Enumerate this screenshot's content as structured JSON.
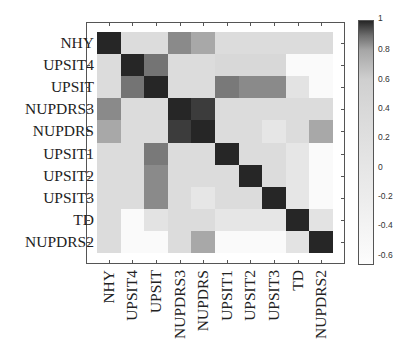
{
  "chart_data": {
    "type": "heatmap",
    "title": "",
    "xlabel": "",
    "ylabel": "",
    "row_labels": [
      "NHY",
      "UPSIT4",
      "UPSIT",
      "NUPDRS3",
      "NUPDRS",
      "UPSIT1",
      "UPSIT2",
      "UPSIT3",
      "TD",
      "NUPDRS2"
    ],
    "col_labels": [
      "NHY",
      "UPSIT4",
      "UPSIT",
      "NUPDRS3",
      "NUPDRS",
      "UPSIT1",
      "UPSIT2",
      "UPSIT3",
      "TD",
      "NUPDRS2"
    ],
    "values": [
      [
        1.0,
        0.3,
        0.3,
        0.85,
        0.79,
        0.3,
        0.3,
        0.3,
        0.3,
        0.3
      ],
      [
        0.3,
        1.0,
        0.89,
        0.3,
        0.3,
        0.4,
        0.4,
        0.4,
        -0.6,
        -0.6
      ],
      [
        0.3,
        0.89,
        1.0,
        0.3,
        0.3,
        0.88,
        0.85,
        0.85,
        0.1,
        -0.6
      ],
      [
        0.85,
        0.3,
        0.3,
        1.0,
        0.97,
        0.3,
        0.3,
        0.3,
        0.3,
        0.3
      ],
      [
        0.79,
        0.3,
        0.3,
        0.97,
        1.0,
        0.3,
        0.3,
        0.0,
        0.3,
        0.79
      ],
      [
        0.3,
        0.3,
        0.88,
        0.3,
        0.3,
        1.0,
        0.3,
        0.3,
        0.0,
        -0.6
      ],
      [
        0.3,
        0.3,
        0.85,
        0.3,
        0.3,
        0.3,
        1.0,
        0.3,
        0.0,
        -0.6
      ],
      [
        0.3,
        0.3,
        0.85,
        0.3,
        0.0,
        0.3,
        0.3,
        1.0,
        0.0,
        -0.6
      ],
      [
        0.3,
        -0.6,
        0.1,
        0.3,
        0.3,
        0.0,
        0.0,
        0.0,
        1.0,
        0.1
      ],
      [
        0.3,
        -0.6,
        -0.6,
        0.3,
        0.79,
        -0.6,
        -0.6,
        -0.6,
        0.1,
        1.0
      ]
    ],
    "colorbar": {
      "ticks": [
        1,
        0.8,
        0.6,
        0.4,
        0.2,
        0,
        -0.2,
        -0.4,
        -0.6
      ],
      "tick_labels": [
        "1",
        "0.8",
        "0.6",
        "0.4",
        "0.2",
        "0",
        "-0.2",
        "-0.4",
        "-0.6"
      ],
      "range": [
        -0.67,
        1
      ],
      "colormap": "gray (dark = high correlation)"
    },
    "grid": false,
    "legend_position": "right (colorbar)"
  }
}
